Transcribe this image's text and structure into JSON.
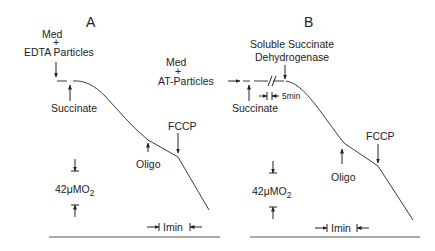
{
  "figure": {
    "panels": [
      {
        "id": "A",
        "label": "A",
        "additions": {
          "initial_line1": "Med",
          "initial_plus": "+",
          "initial_line2": "EDTA Particles",
          "substrate": "Succinate",
          "inhibitor": "Oligo",
          "uncoupler": "FCCP"
        },
        "scale": {
          "oxygen": "42μMO",
          "oxygen_sub": "2",
          "time": "Imin"
        }
      },
      {
        "id": "B",
        "label": "B",
        "additions": {
          "initial_line1": "Med",
          "initial_plus": "+",
          "initial_line2": "AT-Particles",
          "substrate": "Succinate",
          "enzyme_line1": "Soluble Succinate",
          "enzyme_line2": "Dehydrogenase",
          "gap_label": "5min",
          "inhibitor": "Oligo",
          "uncoupler": "FCCP"
        },
        "scale": {
          "oxygen": "42μMO",
          "oxygen_sub": "2",
          "time": "Imin"
        }
      }
    ]
  },
  "colors": {
    "ink": "#222222",
    "trace": "#3a3a3a",
    "background": "#ffffff"
  }
}
